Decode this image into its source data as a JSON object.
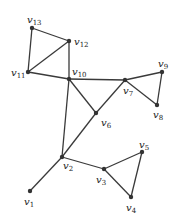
{
  "graph": {
    "nodes": [
      {
        "id": "v1",
        "label": "v",
        "sub": "1",
        "x": 30,
        "y": 191,
        "lx": 24,
        "ly": 205
      },
      {
        "id": "v2",
        "label": "v",
        "sub": "2",
        "x": 62,
        "y": 157,
        "lx": 63,
        "ly": 169
      },
      {
        "id": "v3",
        "label": "v",
        "sub": "3",
        "x": 104,
        "y": 169,
        "lx": 96,
        "ly": 183
      },
      {
        "id": "v4",
        "label": "v",
        "sub": "4",
        "x": 131,
        "y": 197,
        "lx": 126,
        "ly": 211
      },
      {
        "id": "v5",
        "label": "v",
        "sub": "5",
        "x": 142,
        "y": 152,
        "lx": 139,
        "ly": 148
      },
      {
        "id": "v6",
        "label": "v",
        "sub": "6",
        "x": 96,
        "y": 113,
        "lx": 101,
        "ly": 126
      },
      {
        "id": "v7",
        "label": "v",
        "sub": "7",
        "x": 125,
        "y": 80,
        "lx": 123,
        "ly": 94
      },
      {
        "id": "v8",
        "label": "v",
        "sub": "8",
        "x": 157,
        "y": 105,
        "lx": 153,
        "ly": 118
      },
      {
        "id": "v9",
        "label": "v",
        "sub": "9",
        "x": 162,
        "y": 72,
        "lx": 158,
        "ly": 67
      },
      {
        "id": "v10",
        "label": "v",
        "sub": "10",
        "x": 69,
        "y": 79,
        "lx": 72,
        "ly": 75
      },
      {
        "id": "v11",
        "label": "v",
        "sub": "11",
        "x": 28,
        "y": 72,
        "lx": 11,
        "ly": 76
      },
      {
        "id": "v12",
        "label": "v",
        "sub": "12",
        "x": 69,
        "y": 41,
        "lx": 74,
        "ly": 45
      },
      {
        "id": "v13",
        "label": "v",
        "sub": "13",
        "x": 32,
        "y": 28,
        "lx": 27,
        "ly": 23
      }
    ],
    "edges": [
      [
        "v13",
        "v12"
      ],
      [
        "v13",
        "v11"
      ],
      [
        "v11",
        "v12"
      ],
      [
        "v12",
        "v10"
      ],
      [
        "v11",
        "v10"
      ],
      [
        "v10",
        "v7"
      ],
      [
        "v7",
        "v9"
      ],
      [
        "v9",
        "v8"
      ],
      [
        "v7",
        "v8"
      ],
      [
        "v10",
        "v6"
      ],
      [
        "v7",
        "v6"
      ],
      [
        "v10",
        "v2"
      ],
      [
        "v6",
        "v2"
      ],
      [
        "v2",
        "v1"
      ],
      [
        "v2",
        "v3"
      ],
      [
        "v3",
        "v5"
      ],
      [
        "v5",
        "v4"
      ],
      [
        "v3",
        "v4"
      ]
    ]
  }
}
